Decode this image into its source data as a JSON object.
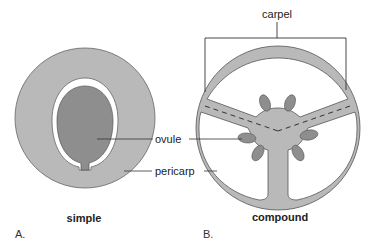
{
  "diagram": {
    "type": "botanical-cross-section",
    "panels": [
      {
        "id": "A",
        "panel_label": "A.",
        "caption": "simple"
      },
      {
        "id": "B",
        "panel_label": "B.",
        "caption": "compound"
      }
    ],
    "labels": {
      "carpel": "carpel",
      "ovule": "ovule",
      "pericarp": "pericarp"
    },
    "colors": {
      "pericarp_fill": "#b9b9b9",
      "ovule_fill": "#8e8e8e",
      "outline": "#555555",
      "background": "#ffffff"
    }
  }
}
